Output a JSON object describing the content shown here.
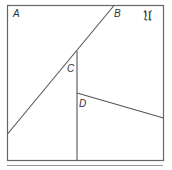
{
  "diagram": {
    "universe_label": "𝔘",
    "points": {
      "A": {
        "label": "A"
      },
      "B": {
        "label": "B"
      },
      "C": {
        "label": "C"
      },
      "D": {
        "label": "D"
      }
    },
    "colors": {
      "stroke": "#555555",
      "frame": "#666666",
      "text": "#333333",
      "rule": "#999999"
    }
  }
}
